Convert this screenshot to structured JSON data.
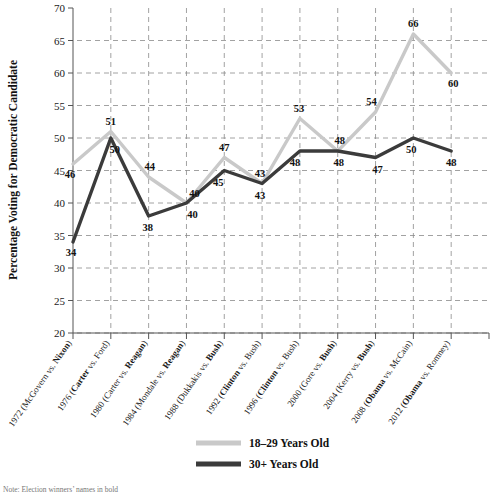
{
  "chart_data": {
    "type": "line",
    "title": "",
    "xlabel": "",
    "ylabel": "Percentage Voting for Democratic Candidate",
    "ylim": [
      20,
      70
    ],
    "yticks": [
      20,
      25,
      30,
      35,
      40,
      45,
      50,
      55,
      60,
      65,
      70
    ],
    "grid": true,
    "legend_position": "bottom",
    "categories": [
      "1972 (McGovern vs. Nixon)",
      "1976 (Carter vs. Ford)",
      "1980 (Carter vs. Reagan)",
      "1984 (Mondale vs. Reagan)",
      "1988 (Dukkakis vs. Bush)",
      "1992 (Clinton vs. Bush)",
      "1996 (Clinton vs. Bush)",
      "2000 (Gore vs. Bush)",
      "2004 (Kerry vs. Bush)",
      "2008 (Obama vs. McCain)",
      "2012 (Obama vs. Romney)"
    ],
    "category_parts": [
      {
        "pre": "1972 (McGovern vs. ",
        "bold": "Nixon",
        "post": ")"
      },
      {
        "pre": "1976 (",
        "bold": "Carter",
        "post": " vs. Ford)"
      },
      {
        "pre": "1980 (Carter vs. ",
        "bold": "Reagan",
        "post": ")"
      },
      {
        "pre": "1984 (Mondale vs. ",
        "bold": "Reagan",
        "post": ")"
      },
      {
        "pre": "1988 (Dukkakis vs. ",
        "bold": "Bush",
        "post": ")"
      },
      {
        "pre": "1992 (",
        "bold": "Clinton",
        "post": " vs. Bush)"
      },
      {
        "pre": "1996 (",
        "bold": "Clinton",
        "post": " vs. Bush)"
      },
      {
        "pre": "2000 (Gore vs. ",
        "bold": "Bush",
        "post": ")"
      },
      {
        "pre": "2004 (Kerry vs. ",
        "bold": "Bush",
        "post": ")"
      },
      {
        "pre": "2008 (",
        "bold": "Obama",
        "post": " vs. McCain)"
      },
      {
        "pre": "2012 (",
        "bold": "Obama",
        "post": " vs. Romney)"
      }
    ],
    "series": [
      {
        "name": "18–29 Years Old",
        "color": "#c9c9c9",
        "values": [
          46,
          51,
          44,
          40,
          47,
          43,
          53,
          48,
          54,
          66,
          60
        ]
      },
      {
        "name": "30+ Years Old",
        "color": "#3b3b3b",
        "values": [
          34,
          50,
          38,
          40,
          45,
          43,
          48,
          48,
          47,
          50,
          48
        ]
      }
    ],
    "point_labels": [
      {
        "series": 0,
        "index": 0,
        "text": "46",
        "dx": -3,
        "dy": 14
      },
      {
        "series": 0,
        "index": 1,
        "text": "51",
        "dx": 0,
        "dy": -7
      },
      {
        "series": 0,
        "index": 2,
        "text": "44",
        "dx": 1,
        "dy": -7
      },
      {
        "series": 0,
        "index": 3,
        "text": "40",
        "dx": 8,
        "dy": -6
      },
      {
        "series": 0,
        "index": 4,
        "text": "47",
        "dx": 0,
        "dy": -7
      },
      {
        "series": 0,
        "index": 5,
        "text": "43",
        "dx": -2,
        "dy": -7
      },
      {
        "series": 0,
        "index": 6,
        "text": "53",
        "dx": -1,
        "dy": -7
      },
      {
        "series": 0,
        "index": 7,
        "text": "48",
        "dx": 2,
        "dy": -7
      },
      {
        "series": 0,
        "index": 8,
        "text": "54",
        "dx": -4,
        "dy": -7
      },
      {
        "series": 0,
        "index": 9,
        "text": "66",
        "dx": 0,
        "dy": -7
      },
      {
        "series": 0,
        "index": 10,
        "text": "60",
        "dx": 2,
        "dy": 14
      }
    ],
    "point_labels_lower": [
      {
        "series": 1,
        "index": 0,
        "text": "34",
        "dx": -2,
        "dy": 14
      },
      {
        "series": 1,
        "index": 1,
        "text": "50",
        "dx": 4,
        "dy": 15
      },
      {
        "series": 1,
        "index": 2,
        "text": "38",
        "dx": -1,
        "dy": 15
      },
      {
        "series": 1,
        "index": 3,
        "text": "40",
        "dx": 6,
        "dy": 15
      },
      {
        "series": 1,
        "index": 4,
        "text": "45",
        "dx": -6,
        "dy": 15
      },
      {
        "series": 1,
        "index": 5,
        "text": "43",
        "dx": -2,
        "dy": 15
      },
      {
        "series": 1,
        "index": 6,
        "text": "48",
        "dx": -5,
        "dy": 15
      },
      {
        "series": 1,
        "index": 7,
        "text": "48",
        "dx": 1,
        "dy": 15
      },
      {
        "series": 1,
        "index": 8,
        "text": "47",
        "dx": 2,
        "dy": 15
      },
      {
        "series": 1,
        "index": 9,
        "text": "50",
        "dx": -2,
        "dy": 15
      },
      {
        "series": 1,
        "index": 10,
        "text": "48",
        "dx": 0,
        "dy": 15
      }
    ]
  },
  "legend": {
    "items": [
      {
        "label": "18–29 Years Old",
        "color": "#c9c9c9"
      },
      {
        "label": "30+ Years Old",
        "color": "#3b3b3b"
      }
    ]
  },
  "note": {
    "text": "Note: Election winners’ names in bold"
  },
  "axes": {
    "y_title": "Percentage Voting for Democratic Candidate"
  }
}
